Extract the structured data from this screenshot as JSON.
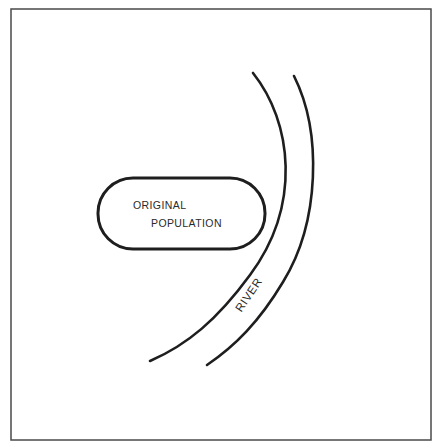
{
  "diagram": {
    "type": "schematic",
    "population": {
      "line1": "ORIGINAL",
      "line2": "POPULATION"
    },
    "river": {
      "label": "RIVER"
    },
    "colors": {
      "background": "#ffffff",
      "stroke": "#1e1e1e",
      "frame": "#4a4a4a",
      "text": "#2a2a2a"
    }
  }
}
